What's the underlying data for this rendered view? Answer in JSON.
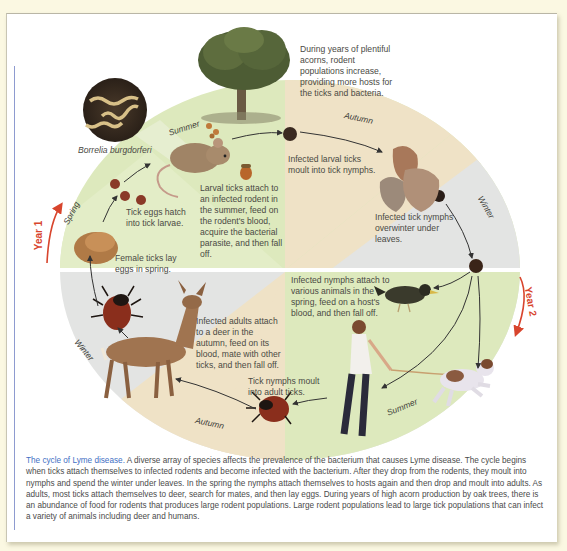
{
  "figure": {
    "title": "The cycle of Lyme disease",
    "colors": {
      "spring_summer_green": "#dde9bd",
      "autumn_tan": "#efe2c6",
      "winter_gray": "#e3e4e3",
      "year_arrow_red": "#d8452d",
      "caption_title_blue": "#3f6fc4",
      "margin_rule": "#8e9bd0",
      "page_bg": "#fbf8e2"
    },
    "bacterium_label": "Borrelia burgdorferi",
    "seasons": {
      "summer_top": "Summer",
      "autumn_top": "Autumn",
      "winter_right": "Winter",
      "spring_left": "Spring",
      "winter_left": "Winter",
      "autumn_bottom": "Autumn",
      "summer_bottom": "Summer"
    },
    "years": {
      "year1": "Year 1",
      "year2": "Year 2"
    },
    "annotations": {
      "acorns": "During years of plentiful acorns, rodent populations increase, providing more hosts for the ticks and bacteria.",
      "larval_moult": "Infected larval ticks moult into tick nymphs.",
      "larval_attach": "Larval ticks attach to an infected rodent in the summer, feed on the rodent's blood, acquire the bacterial parasite, and then fall off.",
      "eggs_hatch": "Tick eggs hatch into tick larvae.",
      "female_lay": "Female ticks lay eggs in spring.",
      "overwinter": "Infected tick nymphs overwinter under leaves.",
      "nymph_attach": "Infected nymphs attach to various animals in the spring, feed on a host's blood, and then fall off.",
      "adults_attach": "Infected adults attach to a deer in the autumn, feed on its blood, mate with other ticks, and then fall off.",
      "nymph_moult": "Tick nymphs moult into adult ticks."
    },
    "caption": {
      "title": "The cycle of Lyme disease.",
      "body": " A diverse array of species affects the prevalence of the bacterium that causes Lyme disease. The cycle begins when ticks attach themselves to infected rodents and become infected with the bacterium. After they drop from the rodents, they moult into nymphs and spend the winter under leaves. In the spring the nymphs attach themselves to hosts again and then drop and moult into adults. As adults, most ticks attach themselves to deer, search for mates, and then lay eggs. During years of high acorn production by oak trees, there is an abundance of food for rodents that produces large rodent populations. Large rodent populations lead to large tick populations that can infect a variety of animals including deer and humans."
    }
  }
}
